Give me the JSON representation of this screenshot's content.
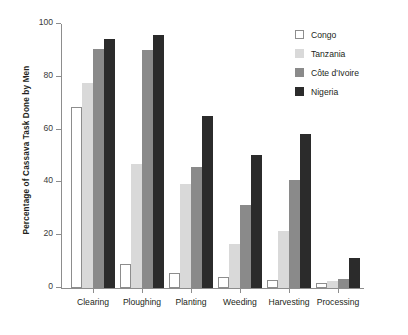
{
  "chart_data": {
    "type": "bar",
    "title": "",
    "xlabel": "",
    "ylabel": "Percentage of Cassava Task Done by Men",
    "ylim": [
      0,
      100
    ],
    "yticks": [
      0,
      20,
      40,
      60,
      80,
      100
    ],
    "ytick_labels": [
      "0",
      "20",
      "40",
      "60",
      "80",
      "100"
    ],
    "grid": false,
    "legend_position": "top-right",
    "categories": [
      "Clearing",
      "Ploughing",
      "Planting",
      "Weeding",
      "Harvesting",
      "Processing"
    ],
    "series": [
      {
        "name": "Congo",
        "color": "#ffffff",
        "border": "#8d8d8d",
        "swatch": "swatch-congo",
        "values": [
          68.5,
          9.0,
          5.5,
          4.0,
          3.0,
          2.0
        ]
      },
      {
        "name": "Tanzania",
        "color": "#d9d9d9",
        "swatch": "swatch-tanzania",
        "values": [
          77.5,
          47.0,
          39.5,
          16.5,
          21.5,
          2.5
        ]
      },
      {
        "name": "Côte d'Ivoire",
        "color": "#8a8a8a",
        "swatch": "swatch-cote",
        "values": [
          90.5,
          90.0,
          46.0,
          31.5,
          41.0,
          3.5
        ]
      },
      {
        "name": "Nigeria",
        "color": "#2b2b2b",
        "swatch": "swatch-nigeria",
        "values": [
          94.5,
          96.0,
          65.0,
          50.5,
          58.5,
          11.5
        ]
      }
    ]
  }
}
